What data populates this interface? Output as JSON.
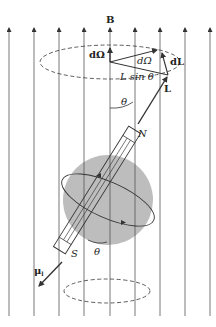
{
  "figure": {
    "colors": {
      "line": "#333333",
      "sphere": "#bdbdbd",
      "background": "#ffffff"
    },
    "labels": {
      "field": "B",
      "d_omega_vec": "dΩ",
      "d_omega_angle": "dΩ",
      "d_l": "dL",
      "l_sin_theta": "L sin θ",
      "angular_momentum": "L",
      "theta_top": "θ",
      "theta_bottom": "θ",
      "north": "N",
      "south": "S",
      "magnetic_moment": "μ",
      "magnetic_moment_sub": "l"
    },
    "field_lines": {
      "count": 9,
      "x_positions": [
        9,
        34,
        59,
        84,
        110,
        135,
        160,
        185,
        210
      ],
      "direction": "up"
    }
  }
}
